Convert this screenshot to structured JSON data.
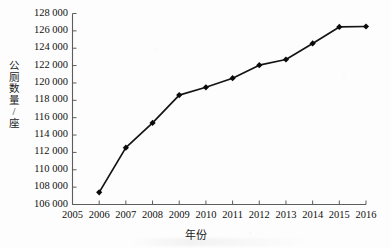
{
  "chart_data": {
    "type": "line",
    "title": "",
    "xlabel": "年份",
    "ylabel": "公厕数量/座",
    "x": [
      2006,
      2007,
      2008,
      2009,
      2010,
      2011,
      2012,
      2013,
      2014,
      2015,
      2016
    ],
    "values": [
      107400,
      112550,
      115400,
      118600,
      119500,
      120550,
      122050,
      122700,
      124550,
      126450,
      126500
    ],
    "series": [
      {
        "name": "公厕数量",
        "values": [
          107400,
          112550,
          115400,
          118600,
          119500,
          120550,
          122050,
          122700,
          124550,
          126450,
          126500
        ]
      }
    ],
    "xlim": [
      2005,
      2016
    ],
    "ylim": [
      106000,
      128000
    ],
    "x_tick_labels": [
      "2005",
      "2006",
      "2007",
      "2008",
      "2009",
      "2010",
      "2011",
      "2012",
      "2013",
      "2014",
      "2015",
      "2016"
    ],
    "y_tick_labels": [
      "106 000",
      "108 000",
      "110 000",
      "112 000",
      "114 000",
      "116 000",
      "118 000",
      "120 000",
      "122 000",
      "124 000",
      "126 000",
      "128 000"
    ],
    "y_tick_values": [
      106000,
      108000,
      110000,
      112000,
      114000,
      116000,
      118000,
      120000,
      122000,
      124000,
      126000,
      128000
    ],
    "y_tick_step": 2000,
    "grid": false,
    "legend": "none",
    "marker": "diamond",
    "line_color": "#141414",
    "marker_color": "#0b0b0b",
    "axis_color": "#5a5a5a",
    "background_color": "#fdfdfd"
  },
  "axis_titles": {
    "y_chars": [
      "公",
      "厕",
      "数",
      "量",
      "/",
      "座"
    ],
    "x": "年份"
  }
}
